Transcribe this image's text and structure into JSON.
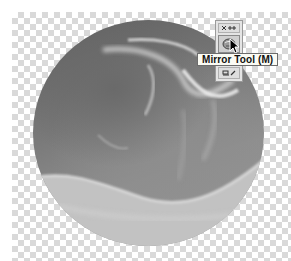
{
  "canvas": {
    "background": "transparency-checkerboard",
    "checker_light": "#ffffff",
    "checker_dark": "#d9d9d9"
  },
  "artwork": {
    "subject": "grayscale-spherical-mirrored-image",
    "shape": "circle"
  },
  "toolbar": {
    "buttons": [
      {
        "name": "zoom-tool",
        "icon": "zoom-icon"
      },
      {
        "name": "mirror-tool",
        "icon": "mirror-icon",
        "active": true
      },
      {
        "name": "paint-tool",
        "icon": "brush-icon"
      }
    ]
  },
  "tooltip": {
    "text": "Mirror Tool (M)"
  },
  "cursor": {
    "type": "arrow-pointer"
  }
}
